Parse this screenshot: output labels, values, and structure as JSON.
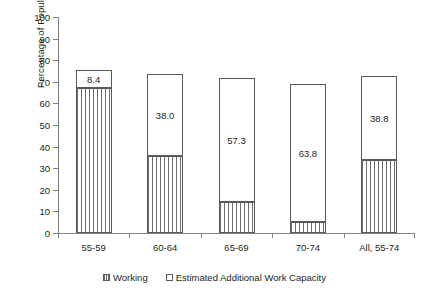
{
  "chart_data": {
    "type": "bar",
    "stacked": true,
    "title": "",
    "xlabel": "",
    "ylabel": "Percentage of Population",
    "ylim": [
      0,
      100
    ],
    "ytick_step": 10,
    "yticks": [
      0,
      10,
      20,
      30,
      40,
      50,
      60,
      70,
      80,
      90,
      100
    ],
    "ytick_labels": [
      "0",
      "10",
      "20",
      "30",
      "40",
      "50",
      "60",
      "70",
      "80",
      "90",
      "100"
    ],
    "grid": false,
    "legend_position": "bottom",
    "categories": [
      "55-59",
      "60-64",
      "65-69",
      "70-74",
      "All, 55-74"
    ],
    "series": [
      {
        "name": "Working",
        "marker": "hatched-square",
        "values": [
          67.1,
          35.6,
          14.5,
          5.2,
          34.0
        ],
        "labels": [
          "",
          "",
          "",
          "",
          ""
        ]
      },
      {
        "name": "Estimated Additional Work Capacity",
        "marker": "open-square",
        "values": [
          8.4,
          38.0,
          57.3,
          63.8,
          38.8
        ],
        "labels": [
          "8.4",
          "38.0",
          "57.3",
          "63.8",
          "38.8"
        ]
      }
    ],
    "totals": [
      75.5,
      73.6,
      71.8,
      69.0,
      72.8
    ],
    "colors": {
      "outline": "#595959",
      "hatch": "#6e6e6e",
      "fill": "#ffffff",
      "axis": "#808080",
      "text": "#231f20"
    }
  },
  "legend": {
    "items": [
      {
        "label": "Working",
        "marker": "hatched-square"
      },
      {
        "label": "Estimated Additional Work Capacity",
        "marker": "open-square"
      }
    ]
  }
}
